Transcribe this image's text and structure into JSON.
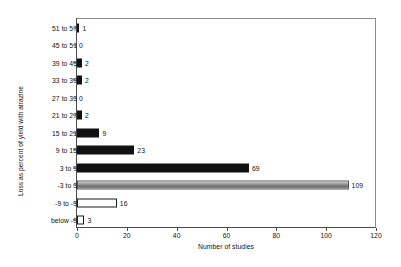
{
  "chart_data": {
    "type": "bar",
    "orientation": "horizontal",
    "title": "",
    "xlabel": "Number of studies",
    "ylabel": "Loss as percent of yield with atrazine",
    "xlim": [
      0,
      120
    ],
    "xticks": [
      0,
      20,
      40,
      60,
      80,
      100,
      120
    ],
    "xtick_labels": [
      "0",
      "20",
      "40",
      "60",
      "80",
      "100",
      "120"
    ],
    "grid": false,
    "legend": "none",
    "categories": [
      "51 to 57",
      "45 to 51",
      "39 to 45",
      "33 to 39",
      "27 to 33",
      "21 to 27",
      "15 to 21",
      "9 to 15",
      "3 to 9",
      "-3 to 3",
      "-9 to -3",
      "below -9"
    ],
    "values": [
      1,
      0,
      2,
      2,
      0,
      2,
      9,
      23,
      69,
      109,
      16,
      3
    ],
    "value_labels": [
      "1",
      "0",
      "2",
      "2",
      "0",
      "2",
      "9",
      "23",
      "69",
      "109",
      "16",
      "3"
    ],
    "bar_styles": [
      "dark",
      "zero",
      "dark",
      "dark",
      "zero",
      "dark",
      "dark",
      "dark",
      "dark",
      "gradient",
      "hollow",
      "hollow"
    ]
  },
  "colors": {
    "bar_dark": "#111111",
    "bar_gradient_light": "#d8d8d8",
    "bar_gradient_dark": "#6f6f6f",
    "bar_hollow_fill": "#ffffff",
    "bar_hollow_stroke": "#1a1a1a",
    "axis": "#4a4a4a",
    "frame": "#8c8c8c",
    "text": "#111111",
    "background": "#ffffff"
  }
}
